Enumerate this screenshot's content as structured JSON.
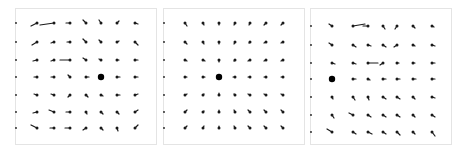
{
  "figure": {
    "stroke_color": "#1a1a1a",
    "border_color": "#e4e4e4",
    "panels": [
      {
        "name": "panel-left",
        "box": [
          15,
          8,
          140,
          135
        ],
        "grid_x": [
          37,
          54,
          70,
          86,
          101,
          117,
          135
        ],
        "grid_y": [
          23,
          42,
          60,
          77,
          95,
          112,
          128
        ],
        "center": [
          101,
          77
        ],
        "edge_marks_x": 15,
        "vectors": [
          [
            [
              6,
              -3
            ],
            [
              14,
              -2
            ],
            [
              4,
              0
            ],
            [
              3,
              3
            ],
            [
              2,
              3
            ],
            [
              -2,
              2
            ],
            [
              -3,
              -1
            ]
          ],
          [
            [
              5,
              -3
            ],
            [
              3,
              -1
            ],
            [
              3,
              0
            ],
            [
              3,
              3
            ],
            [
              2,
              2
            ],
            [
              -2,
              1
            ],
            [
              -3,
              -3
            ]
          ],
          [
            [
              4,
              -1
            ],
            [
              3,
              -1
            ],
            [
              10,
              0
            ],
            [
              3,
              2
            ],
            [
              2,
              1
            ],
            [
              -2,
              0
            ],
            [
              -3,
              0
            ]
          ],
          [
            [
              3,
              0
            ],
            [
              3,
              0
            ],
            [
              2,
              2
            ],
            [
              -3,
              0
            ],
            [
              0,
              0
            ],
            [
              -3,
              0
            ],
            [
              -3,
              0
            ]
          ],
          [
            [
              3,
              1
            ],
            [
              3,
              1
            ],
            [
              2,
              -2
            ],
            [
              -2,
              -2
            ],
            [
              -2,
              -1
            ],
            [
              -3,
              0
            ],
            [
              -3,
              1
            ]
          ],
          [
            [
              4,
              -1
            ],
            [
              5,
              2
            ],
            [
              4,
              0
            ],
            [
              -1,
              -2
            ],
            [
              -2,
              -2
            ],
            [
              -2,
              -2
            ],
            [
              -3,
              2
            ]
          ],
          [
            [
              6,
              3
            ],
            [
              4,
              0
            ],
            [
              5,
              0
            ],
            [
              3,
              -2
            ],
            [
              -2,
              -2
            ],
            [
              -1,
              -3
            ],
            [
              -3,
              3
            ]
          ]
        ]
      },
      {
        "name": "panel-middle",
        "box": [
          163,
          8,
          140,
          135
        ],
        "grid_x": [
          185,
          203,
          219,
          235,
          250,
          266,
          283
        ],
        "grid_y": [
          23,
          42,
          60,
          77,
          95,
          112,
          128
        ],
        "center": [
          219,
          77
        ],
        "edge_marks_x": 163,
        "vectors": [
          [
            [
              -2,
              -3
            ],
            [
              -1,
              -2
            ],
            [
              0,
              -2
            ],
            [
              1,
              -2
            ],
            [
              1,
              -2
            ],
            [
              2,
              -2
            ],
            [
              2,
              -2
            ]
          ],
          [
            [
              -2,
              -2
            ],
            [
              -1,
              -2
            ],
            [
              0,
              -2
            ],
            [
              1,
              -2
            ],
            [
              1,
              -1
            ],
            [
              2,
              -1
            ],
            [
              2,
              -1
            ]
          ],
          [
            [
              -2,
              -1
            ],
            [
              -2,
              -1
            ],
            [
              0,
              -2
            ],
            [
              1,
              -1
            ],
            [
              2,
              -1
            ],
            [
              2,
              -1
            ],
            [
              2,
              -1
            ]
          ],
          [
            [
              -2,
              0
            ],
            [
              -2,
              0
            ],
            [
              0,
              0
            ],
            [
              2,
              0
            ],
            [
              2,
              0
            ],
            [
              2,
              0
            ],
            [
              2,
              0
            ]
          ],
          [
            [
              -2,
              1
            ],
            [
              -1,
              1
            ],
            [
              0,
              2
            ],
            [
              1,
              1
            ],
            [
              2,
              1
            ],
            [
              2,
              1
            ],
            [
              2,
              1
            ]
          ],
          [
            [
              -2,
              2
            ],
            [
              -1,
              1
            ],
            [
              0,
              2
            ],
            [
              1,
              2
            ],
            [
              2,
              2
            ],
            [
              2,
              2
            ],
            [
              2,
              2
            ]
          ],
          [
            [
              -2,
              2
            ],
            [
              -1,
              2
            ],
            [
              0,
              2
            ],
            [
              1,
              2
            ],
            [
              2,
              2
            ],
            [
              2,
              2
            ],
            [
              2,
              2
            ]
          ]
        ]
      },
      {
        "name": "panel-right",
        "box": [
          310,
          8,
          140,
          135
        ],
        "grid_x": [
          332,
          353,
          368,
          383,
          397,
          413,
          432
        ],
        "grid_y": [
          26,
          45,
          63,
          79,
          97,
          115,
          132
        ],
        "center": [
          332,
          79
        ],
        "edge_marks_x": 310,
        "vectors": [
          [
            [
              3,
              2
            ],
            [
              -12,
              2
            ],
            [
              5,
              0
            ],
            [
              -2,
              -3
            ],
            [
              2,
              -3
            ],
            [
              -2,
              -2
            ],
            [
              -2,
              -1
            ]
          ],
          [
            [
              3,
              2
            ],
            [
              -3,
              -2
            ],
            [
              -3,
              -1
            ],
            [
              -3,
              -2
            ],
            [
              3,
              -2
            ],
            [
              -2,
              -1
            ],
            [
              -3,
              -1
            ]
          ],
          [
            [
              -3,
              -1
            ],
            [
              -3,
              -1
            ],
            [
              -10,
              0
            ],
            [
              3,
              -2
            ],
            [
              -2,
              0
            ],
            [
              -2,
              0
            ],
            [
              -3,
              0
            ]
          ],
          [
            [
              0,
              0
            ],
            [
              -3,
              0
            ],
            [
              -2,
              -1
            ],
            [
              -3,
              0
            ],
            [
              -3,
              0
            ],
            [
              -3,
              0
            ],
            [
              -3,
              0
            ]
          ],
          [
            [
              -1,
              -2
            ],
            [
              -2,
              -3
            ],
            [
              -1,
              -3
            ],
            [
              -3,
              -2
            ],
            [
              -3,
              -2
            ],
            [
              -2,
              -2
            ],
            [
              -3,
              -1
            ]
          ],
          [
            [
              -2,
              -3
            ],
            [
              4,
              2
            ],
            [
              -3,
              -2
            ],
            [
              -3,
              -2
            ],
            [
              -3,
              -2
            ],
            [
              -2,
              -2
            ],
            [
              -3,
              -2
            ]
          ],
          [
            [
              5,
              3
            ],
            [
              -3,
              -2
            ],
            [
              -4,
              -2
            ],
            [
              -3,
              -2
            ],
            [
              -3,
              -3
            ],
            [
              -2,
              -2
            ],
            [
              -3,
              -4
            ]
          ]
        ]
      }
    ]
  }
}
